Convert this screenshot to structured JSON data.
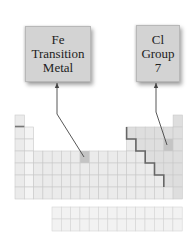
{
  "labels": {
    "fe": {
      "symbol": "Fe",
      "line2": "Transition",
      "line3": "Metal"
    },
    "cl": {
      "symbol": "Cl",
      "line2": "Group",
      "line3": "7"
    }
  },
  "colors": {
    "box_fill": "#d3d3d3",
    "cell_fill": "#ebebeb",
    "cell_fill_light": "#f4f4f4",
    "cell_border": "#c9c9c9",
    "nonmetal_fill": "#dedede",
    "highlight_fill": "#c4c4c4",
    "staircase": "#666666",
    "arrow": "#444444"
  },
  "table": {
    "origin_x": 15,
    "origin_y": 115,
    "cell_w": 9.3,
    "cell_h": 12,
    "highlighted": [
      {
        "name": "Fe",
        "period": 4,
        "group": 8
      },
      {
        "name": "Cl",
        "period": 3,
        "group": 17
      }
    ]
  }
}
